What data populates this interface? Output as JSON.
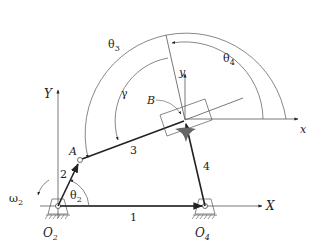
{
  "diagram": {
    "links": [
      {
        "id": "1",
        "label": "1",
        "from": "O2",
        "to": "O4"
      },
      {
        "id": "2",
        "label": "2",
        "from": "O2",
        "to": "A"
      },
      {
        "id": "3",
        "label": "3",
        "from": "A",
        "to": "B"
      },
      {
        "id": "4",
        "label": "4",
        "from": "O4",
        "to": "B"
      }
    ],
    "points": {
      "O2": "O",
      "O2_sub": "2",
      "O4": "O",
      "O4_sub": "4",
      "A": "A",
      "B": "B"
    },
    "axes": {
      "global_x": "X",
      "global_y": "Y",
      "local_x": "x",
      "local_y": "y"
    },
    "angles": {
      "theta": "θ",
      "theta2_sub": "2",
      "theta3_sub": "3",
      "theta4_sub": "4",
      "gamma": "γ",
      "omega": "ω",
      "omega2_sub": "2"
    },
    "colors": {
      "line": "#222222",
      "thin": "#555555",
      "fill": "#666666"
    }
  }
}
